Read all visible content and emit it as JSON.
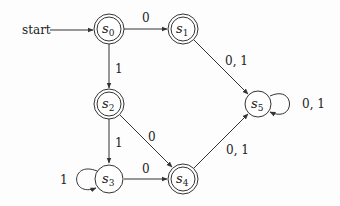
{
  "diagram": {
    "type": "finite-state-automaton",
    "start_label": "start",
    "start_state": "s0",
    "states": [
      {
        "id": "s0",
        "base": "s",
        "sub": "0",
        "accepting": true,
        "x": 109,
        "y": 29
      },
      {
        "id": "s1",
        "base": "s",
        "sub": "1",
        "accepting": true,
        "x": 183,
        "y": 29
      },
      {
        "id": "s2",
        "base": "s",
        "sub": "2",
        "accepting": true,
        "x": 109,
        "y": 104
      },
      {
        "id": "s3",
        "base": "s",
        "sub": "3",
        "accepting": false,
        "x": 109,
        "y": 179
      },
      {
        "id": "s4",
        "base": "s",
        "sub": "4",
        "accepting": true,
        "x": 183,
        "y": 179
      },
      {
        "id": "s5",
        "base": "s",
        "sub": "5",
        "accepting": false,
        "x": 258,
        "y": 104
      }
    ],
    "transitions": [
      {
        "from": "s0",
        "to": "s1",
        "label": "0"
      },
      {
        "from": "s0",
        "to": "s2",
        "label": "1"
      },
      {
        "from": "s1",
        "to": "s5",
        "label": "0, 1"
      },
      {
        "from": "s2",
        "to": "s3",
        "label": "1"
      },
      {
        "from": "s2",
        "to": "s4",
        "label": "0"
      },
      {
        "from": "s3",
        "to": "s3",
        "label": "1"
      },
      {
        "from": "s3",
        "to": "s4",
        "label": "0"
      },
      {
        "from": "s4",
        "to": "s5",
        "label": "0, 1"
      },
      {
        "from": "s5",
        "to": "s5",
        "label": "0, 1"
      }
    ]
  },
  "labels": {
    "start": "start",
    "s": "s",
    "sub0": "0",
    "sub1": "1",
    "sub2": "2",
    "sub3": "3",
    "sub4": "4",
    "sub5": "5",
    "t_s0_s1": "0",
    "t_s0_s2": "1",
    "t_s1_s5": "0, 1",
    "t_s2_s3": "1",
    "t_s2_s4": "0",
    "t_s3_s3": "1",
    "t_s3_s4": "0",
    "t_s4_s5": "0, 1",
    "t_s5_s5": "0, 1"
  }
}
